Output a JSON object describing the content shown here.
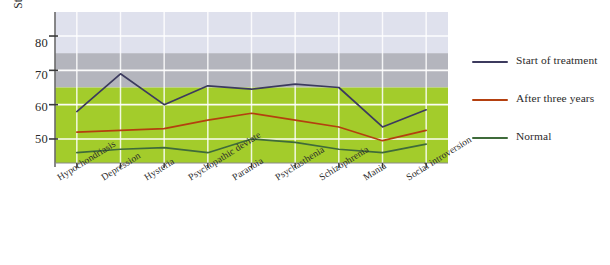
{
  "chart_data": {
    "type": "line",
    "title": "",
    "xlabel": "",
    "ylabel": "Standard (T) score",
    "categories": [
      "Hypochondriasis",
      "Depression",
      "Hysteria",
      "Psychopathic deviate",
      "Paranoia",
      "Psychasthenia",
      "Schizophrenia",
      "Mania",
      "Social introversion"
    ],
    "yticks": [
      50,
      60,
      70,
      80
    ],
    "ylim": [
      43,
      87
    ],
    "grid": true,
    "legend_position": "right",
    "series": [
      {
        "name": "Start of treatment",
        "color": "#3c3a5e",
        "values": [
          58,
          69,
          60,
          65.5,
          64.5,
          66,
          65,
          53.5,
          58.5
        ]
      },
      {
        "name": "After three years",
        "color": "#b4400f",
        "values": [
          52,
          52.5,
          53,
          55.5,
          57.5,
          55.5,
          53.5,
          49.5,
          52.5
        ]
      },
      {
        "name": "Normal",
        "color": "#3f6b3a",
        "values": [
          46,
          47,
          47.5,
          46,
          50,
          49,
          47,
          46,
          48.5
        ]
      }
    ],
    "bands": [
      {
        "name": "upper-lavender-band",
        "from": 75,
        "to": 87,
        "color": "#dfe1ed"
      },
      {
        "name": "middle-gray-band",
        "from": 65,
        "to": 75,
        "color": "#b4b5bd"
      },
      {
        "name": "lower-green-band",
        "from": 43,
        "to": 65,
        "color": "#a3cc2b"
      }
    ]
  },
  "axis": {
    "y_label": "Standard (T) score",
    "y_tick_labels": [
      "80",
      "70",
      "60",
      "50"
    ]
  },
  "legend": {
    "items": [
      {
        "label": "Start of treatment",
        "color": "#3c3a5e"
      },
      {
        "label": "After three years",
        "color": "#b4400f"
      },
      {
        "label": "Normal",
        "color": "#3f6b3a"
      }
    ]
  }
}
